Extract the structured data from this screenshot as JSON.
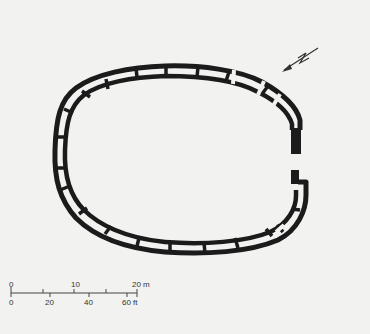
{
  "figure": {
    "type": "architectural-plan"
  },
  "north_arrow": {
    "label": "N",
    "icon": "north-arrow-icon"
  },
  "scale_bar": {
    "metric": {
      "ticks": [
        "0",
        "10",
        "20 m"
      ]
    },
    "imperial": {
      "ticks": [
        "0",
        "20",
        "40",
        "60 ft"
      ]
    }
  },
  "colors": {
    "ink": "#1b1b1b",
    "paper": "#f2f2f0"
  }
}
